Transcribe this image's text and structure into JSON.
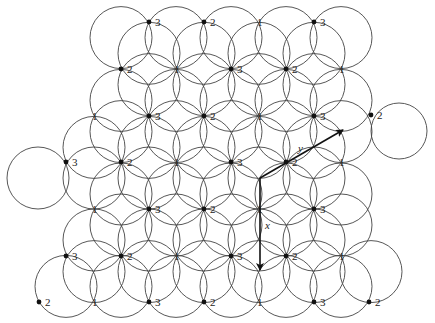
{
  "figure": {
    "circle_radius": 31,
    "stroke_color": "#444444",
    "dot_color": "#111111"
  },
  "bands": [
    {
      "name": "band-0",
      "y_down": 37.6,
      "y_up": 53.3,
      "x_down": [
        121,
        176,
        231,
        286,
        341
      ],
      "x_up": [
        149,
        204,
        259,
        314
      ]
    },
    {
      "name": "band-1",
      "y_down": 84.6,
      "y_up": 100.4,
      "x_down": [
        149,
        204,
        259,
        314
      ],
      "x_up": [
        121,
        176,
        231,
        286,
        341
      ]
    },
    {
      "name": "band-2",
      "y_down": 131.6,
      "y_up": 147.4,
      "x_down": [
        121,
        176,
        231,
        286,
        341
      ],
      "x_up": [
        94,
        149,
        204,
        259,
        314
      ]
    },
    {
      "name": "band-3",
      "y_down": 178,
      "y_up": 194,
      "x_down": [
        38,
        94,
        149,
        204,
        259,
        314
      ],
      "x_up": [
        121,
        176,
        231,
        286,
        341
      ]
    },
    {
      "name": "band-4",
      "y_down": 225,
      "y_up": 240,
      "x_down": [
        121,
        176,
        231,
        286,
        341
      ],
      "x_up": [
        94,
        149,
        204,
        259,
        314
      ]
    },
    {
      "name": "band-5",
      "y_down": 271.6,
      "y_up": 286.4,
      "x_down": [
        94,
        149,
        204,
        259,
        314,
        371
      ],
      "x_up": [
        66,
        121,
        176,
        231,
        286,
        341
      ]
    }
  ],
  "extra_circles": [
    {
      "cx": 399,
      "cy": 131,
      "r": 28
    }
  ],
  "markers": [
    {
      "x": 149,
      "y": 22,
      "label": "3",
      "dot": true
    },
    {
      "x": 204,
      "y": 22,
      "label": "2",
      "dot": true
    },
    {
      "x": 259,
      "y": 22,
      "label": "1",
      "dot": false
    },
    {
      "x": 314,
      "y": 22,
      "label": "3",
      "dot": true
    },
    {
      "x": 121,
      "y": 69,
      "label": "2",
      "dot": true
    },
    {
      "x": 176,
      "y": 69,
      "label": "1",
      "dot": false
    },
    {
      "x": 231,
      "y": 69,
      "label": "3",
      "dot": true
    },
    {
      "x": 286,
      "y": 69,
      "label": "2",
      "dot": true
    },
    {
      "x": 341,
      "y": 69,
      "label": "1",
      "dot": false
    },
    {
      "x": 94,
      "y": 116,
      "label": "1",
      "dot": false
    },
    {
      "x": 149,
      "y": 116,
      "label": "3",
      "dot": true
    },
    {
      "x": 204,
      "y": 116,
      "label": "2",
      "dot": true
    },
    {
      "x": 259,
      "y": 116,
      "label": "1",
      "dot": false
    },
    {
      "x": 314,
      "y": 116,
      "label": "3",
      "dot": true
    },
    {
      "x": 371,
      "y": 115,
      "label": "2",
      "dot": true
    },
    {
      "x": 66,
      "y": 162,
      "label": "3",
      "dot": true
    },
    {
      "x": 121,
      "y": 162,
      "label": "2",
      "dot": true
    },
    {
      "x": 176,
      "y": 162,
      "label": "1",
      "dot": false
    },
    {
      "x": 231,
      "y": 162,
      "label": "3",
      "dot": true
    },
    {
      "x": 286,
      "y": 162,
      "label": "2",
      "dot": true
    },
    {
      "x": 341,
      "y": 162,
      "label": "1",
      "dot": false
    },
    {
      "x": 94,
      "y": 209,
      "label": "1",
      "dot": false
    },
    {
      "x": 149,
      "y": 209,
      "label": "3",
      "dot": true
    },
    {
      "x": 204,
      "y": 209,
      "label": "2",
      "dot": true
    },
    {
      "x": 259,
      "y": 209,
      "label": "1",
      "dot": false
    },
    {
      "x": 314,
      "y": 209,
      "label": "3",
      "dot": true
    },
    {
      "x": 66,
      "y": 256,
      "label": "3",
      "dot": true
    },
    {
      "x": 121,
      "y": 256,
      "label": "2",
      "dot": true
    },
    {
      "x": 176,
      "y": 256,
      "label": "1",
      "dot": false
    },
    {
      "x": 231,
      "y": 256,
      "label": "3",
      "dot": true
    },
    {
      "x": 286,
      "y": 256,
      "label": "2",
      "dot": true
    },
    {
      "x": 341,
      "y": 256,
      "label": "1",
      "dot": false
    },
    {
      "x": 39,
      "y": 302,
      "label": "2",
      "dot": true
    },
    {
      "x": 94,
      "y": 302,
      "label": "1",
      "dot": false
    },
    {
      "x": 149,
      "y": 302,
      "label": "3",
      "dot": true
    },
    {
      "x": 204,
      "y": 302,
      "label": "2",
      "dot": true
    },
    {
      "x": 259,
      "y": 302,
      "label": "1",
      "dot": false
    },
    {
      "x": 314,
      "y": 302,
      "label": "3",
      "dot": true
    },
    {
      "x": 369,
      "y": 302,
      "label": "2",
      "dot": true
    }
  ],
  "axes": {
    "origin": {
      "x": 260,
      "y": 178
    },
    "x_axis": {
      "label": "x",
      "end": {
        "x": 260,
        "y": 270
      },
      "label_pos": {
        "x": 265,
        "y": 229
      }
    },
    "y_axis": {
      "label": "y",
      "end": {
        "x": 343,
        "y": 130
      },
      "label_pos": {
        "x": 298,
        "y": 152
      }
    }
  }
}
